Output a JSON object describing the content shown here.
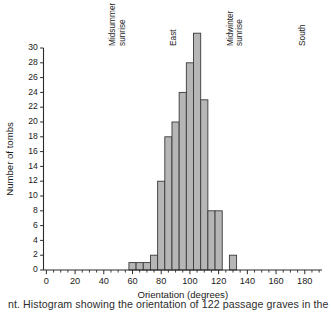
{
  "figure": {
    "caption_partial": "nt. Histogram showing the orientation of 122 passage graves in the"
  },
  "chart_data": {
    "type": "bar",
    "title": "",
    "subtitle": "",
    "xlabel": "Orientation (degrees)",
    "ylabel": "Number of tombs",
    "xlim": [
      -2,
      192
    ],
    "ylim": [
      0,
      30
    ],
    "grid": false,
    "legend": null,
    "bin_width": 5,
    "x_ticks_major": [
      0,
      20,
      40,
      60,
      80,
      100,
      120,
      140,
      160,
      180
    ],
    "x_ticks_minor_step": 5,
    "y_ticks": [
      0,
      2,
      4,
      6,
      8,
      10,
      12,
      14,
      16,
      18,
      20,
      22,
      24,
      26,
      28,
      30
    ],
    "bars": [
      {
        "bin_start": 57.5,
        "bin_end": 62.5,
        "center": 60,
        "value": 1
      },
      {
        "bin_start": 62.5,
        "bin_end": 67.5,
        "center": 65,
        "value": 1
      },
      {
        "bin_start": 67.5,
        "bin_end": 72.5,
        "center": 70,
        "value": 1
      },
      {
        "bin_start": 72.5,
        "bin_end": 77.5,
        "center": 75,
        "value": 2
      },
      {
        "bin_start": 77.5,
        "bin_end": 82.5,
        "center": 80,
        "value": 12
      },
      {
        "bin_start": 82.5,
        "bin_end": 87.5,
        "center": 85,
        "value": 18
      },
      {
        "bin_start": 87.5,
        "bin_end": 92.5,
        "center": 90,
        "value": 20
      },
      {
        "bin_start": 92.5,
        "bin_end": 97.5,
        "center": 95,
        "value": 24
      },
      {
        "bin_start": 97.5,
        "bin_end": 102.5,
        "center": 100,
        "value": 28
      },
      {
        "bin_start": 102.5,
        "bin_end": 107.5,
        "center": 105,
        "value": 32
      },
      {
        "bin_start": 107.5,
        "bin_end": 112.5,
        "center": 110,
        "value": 23
      },
      {
        "bin_start": 112.5,
        "bin_end": 117.5,
        "center": 115,
        "value": 8
      },
      {
        "bin_start": 117.5,
        "bin_end": 122.5,
        "center": 120,
        "value": 8
      },
      {
        "bin_start": 127.5,
        "bin_end": 132.5,
        "center": 130,
        "value": 2
      }
    ],
    "annotations": [
      {
        "id": "midsummer-sunrise",
        "text": "Midsummer\nsunrise",
        "line1": "Midsummer",
        "line2": "sunrise",
        "x": 48,
        "rotation": -90
      },
      {
        "id": "east",
        "text": "East",
        "line1": "East",
        "line2": "",
        "x": 90,
        "rotation": -90
      },
      {
        "id": "midwinter-sunrise",
        "text": "Midwinter\nsunrise",
        "line1": "Midwinter",
        "line2": "sunrise",
        "x": 130,
        "rotation": -90
      },
      {
        "id": "south",
        "text": "South",
        "line1": "South",
        "line2": "",
        "x": 180,
        "rotation": -90
      }
    ],
    "colors": {
      "bar_fill": "#b6b6b6",
      "bar_stroke": "#3a3a3a",
      "axis": "#2b2b2b",
      "text": "#1a1a1a",
      "background": "#ffffff"
    }
  }
}
